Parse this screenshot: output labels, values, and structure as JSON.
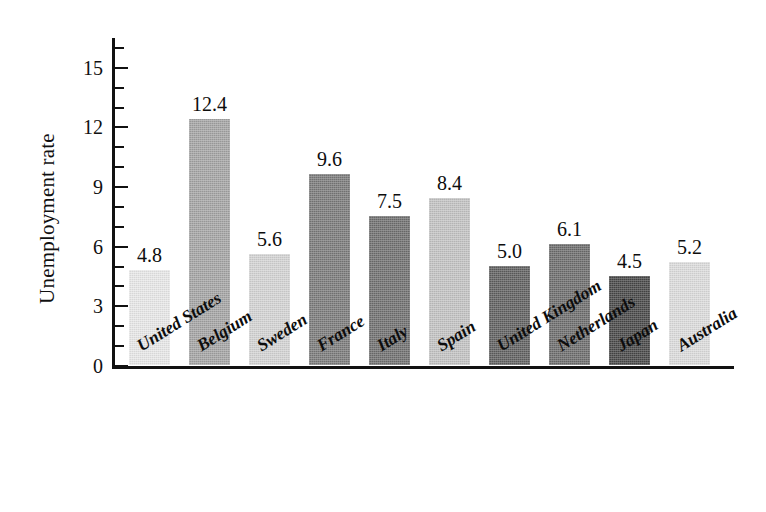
{
  "chart_data": {
    "type": "bar",
    "title": "",
    "subtitle": "",
    "xlabel": "",
    "ylabel": "Unemployment rate",
    "categories": [
      "United States",
      "Belgium",
      "Sweden",
      "France",
      "Italy",
      "Spain",
      "United Kingdom",
      "Netherlands",
      "Japan",
      "Australia"
    ],
    "values": [
      4.8,
      12.4,
      5.6,
      9.6,
      7.5,
      8.4,
      5.0,
      6.1,
      4.5,
      5.2
    ],
    "value_labels": [
      "4.8",
      "12.4",
      "5.6",
      "9.6",
      "7.5",
      "8.4",
      "5.0",
      "6.1",
      "4.5",
      "5.2"
    ],
    "bar_colors": [
      "#e9e9e9",
      "#a4a4a4",
      "#d4d4d4",
      "#7a7a7a",
      "#6f6f6f",
      "#c3c3c3",
      "#5f5f5f",
      "#6c6c6c",
      "#464646",
      "#dddddd"
    ],
    "ylim": [
      0,
      16.5
    ],
    "ytick_labels": [
      "0",
      "3",
      "6",
      "9",
      "12",
      "15"
    ],
    "ytick_values": [
      0,
      3,
      6,
      9,
      12,
      15
    ],
    "yminor_tick_values": [
      1,
      2,
      4,
      5,
      7,
      8,
      10,
      11,
      13,
      14,
      16
    ],
    "grid": false,
    "legend": false,
    "legend_position": "none",
    "data_labels_shown": true,
    "xlabel_rotation_deg": -32,
    "axis_color": "#111111",
    "background_color": "#ffffff",
    "text_color": "#0d0d0d"
  }
}
